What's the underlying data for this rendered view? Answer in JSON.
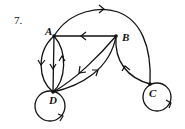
{
  "problem_number": "7.",
  "graph": {
    "type": "directed multigraph",
    "nodes": [
      {
        "id": "A",
        "label": "A"
      },
      {
        "id": "B",
        "label": "B"
      },
      {
        "id": "C",
        "label": "C"
      },
      {
        "id": "D",
        "label": "D"
      }
    ],
    "edges": [
      {
        "from": "A",
        "to": "C",
        "shape": "arc-over-top"
      },
      {
        "from": "B",
        "to": "A",
        "shape": "straight"
      },
      {
        "from": "A",
        "to": "D",
        "shape": "curve-left"
      },
      {
        "from": "A",
        "to": "D",
        "shape": "straight"
      },
      {
        "from": "D",
        "to": "A",
        "shape": "curve-right"
      },
      {
        "from": "B",
        "to": "D",
        "shape": "straight"
      },
      {
        "from": "D",
        "to": "B",
        "shape": "curve"
      },
      {
        "from": "C",
        "to": "B",
        "shape": "curve"
      },
      {
        "from": "D",
        "to": "D",
        "shape": "loop"
      },
      {
        "from": "C",
        "to": "C",
        "shape": "loop"
      }
    ]
  }
}
